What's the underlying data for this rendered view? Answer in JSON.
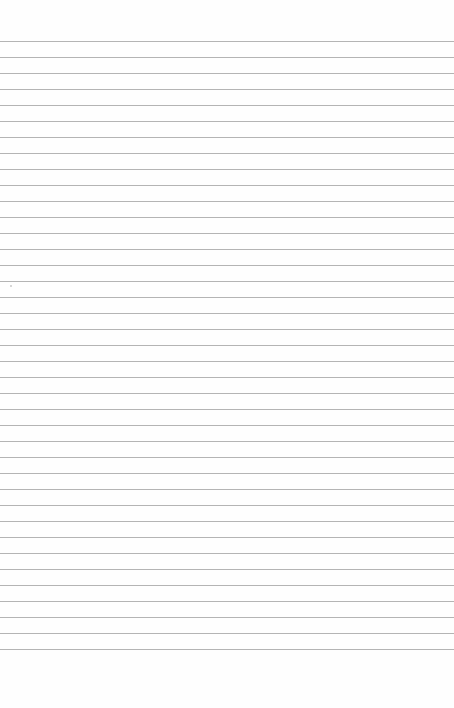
{
  "page": {
    "type": "ruled-paper",
    "background_color": "#fefefe",
    "line_color": "#b4b4b4",
    "first_line_y": 41,
    "line_spacing": 16,
    "line_count": 39,
    "text": ""
  }
}
